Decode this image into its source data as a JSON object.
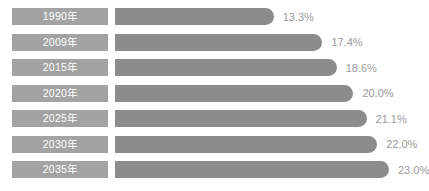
{
  "chart_data": {
    "type": "bar",
    "orientation": "horizontal",
    "title": "",
    "subtitle": "",
    "xlabel": "",
    "ylabel": "",
    "grid": false,
    "legend": null,
    "xlim": [
      0,
      25
    ],
    "value_suffix": "%",
    "categories": [
      "1990年",
      "2009年",
      "2015年",
      "2020年",
      "2025年",
      "2030年",
      "2035年"
    ],
    "values": [
      13.3,
      17.4,
      18.6,
      20.0,
      21.1,
      22.0,
      23.0
    ],
    "value_labels": [
      "13.3%",
      "17.4%",
      "18.6%",
      "20.0%",
      "21.1%",
      "22.0%",
      "23.0%"
    ],
    "colors": {
      "bar": "#8c8c8c",
      "category_pill": "#a3a3a3",
      "category_text": "#ffffff",
      "value_text": "#9a9a9a",
      "background": "#ffffff"
    }
  },
  "rows": [
    {
      "category": "1990年",
      "value_label": "13.3%",
      "bar_pct": 57.9
    },
    {
      "category": "2009年",
      "value_label": "17.4%",
      "bar_pct": 75.7
    },
    {
      "category": "2015年",
      "value_label": "18.6%",
      "bar_pct": 80.9
    },
    {
      "category": "2020年",
      "value_label": "20.0%",
      "bar_pct": 87.0
    },
    {
      "category": "2025年",
      "value_label": "21.1%",
      "bar_pct": 91.8
    },
    {
      "category": "2030年",
      "value_label": "22.0%",
      "bar_pct": 95.7
    },
    {
      "category": "2035年",
      "value_label": "23.0%",
      "bar_pct": 100.0
    }
  ]
}
